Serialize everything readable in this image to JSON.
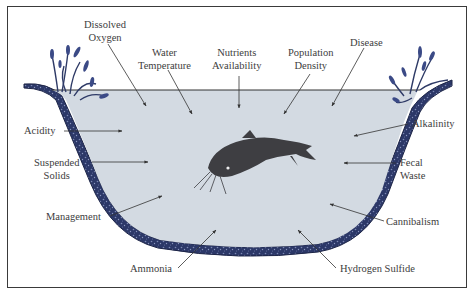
{
  "diagram": {
    "center_subject": "catfish",
    "colors": {
      "water": "#d3dae2",
      "pond_liner": "#2c3868",
      "liner_speckle": "#7d89b4",
      "plants": "#2e3a66",
      "fish": "#3e3e42",
      "text": "#3d3d3d",
      "arrow": "#333333",
      "border": "#3a3a3a"
    },
    "labels": {
      "dissolved_oxygen": {
        "line1": "Dissolved",
        "line2": "Oxygen"
      },
      "water_temperature": {
        "line1": "Water",
        "line2": "Temperature"
      },
      "nutrients_availability": {
        "line1": "Nutrients",
        "line2": "Availability"
      },
      "population_density": {
        "line1": "Population",
        "line2": "Density"
      },
      "disease": {
        "line1": "Disease"
      },
      "acidity": {
        "line1": "Acidity"
      },
      "alkalinity": {
        "line1": "Alkalinity"
      },
      "suspended_solids": {
        "line1": "Suspended",
        "line2": "Solids"
      },
      "fecal_waste": {
        "line1": "Fecal",
        "line2": "Waste"
      },
      "management": {
        "line1": "Management"
      },
      "cannibalism": {
        "line1": "Cannibalism"
      },
      "ammonia": {
        "line1": "Ammonia"
      },
      "hydrogen_sulfide": {
        "line1": "Hydrogen Sulfide"
      }
    }
  }
}
